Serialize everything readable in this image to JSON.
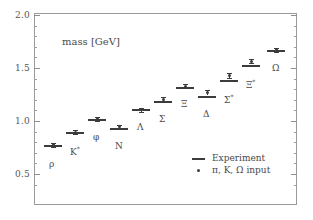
{
  "chart_data": {
    "type": "scatter",
    "title": "mass [GeV]",
    "xlabel": "",
    "ylabel": "mass [GeV]",
    "ylim": [
      0.35,
      2.0
    ],
    "yticks": [
      "2.0",
      "1.5",
      "1.0",
      "0.5"
    ],
    "ytick_values": [
      2.0,
      1.5,
      1.0,
      0.5
    ],
    "grid": false,
    "legend_position": "lower right",
    "categories": [
      "rho",
      "K*",
      "phi",
      "N",
      "Lambda",
      "Sigma",
      "Xi",
      "Delta",
      "Sigma*",
      "Xi*",
      "Omega"
    ],
    "series": [
      {
        "name": "Experiment",
        "marker": "bar",
        "values": [
          0.77,
          0.895,
          1.019,
          0.939,
          1.116,
          1.193,
          1.318,
          1.232,
          1.385,
          1.533,
          1.672
        ]
      },
      {
        "name": "pi, K, Omega input",
        "marker": "dot",
        "values": [
          0.775,
          0.893,
          1.02,
          0.945,
          1.104,
          1.205,
          1.33,
          1.267,
          1.43,
          1.565,
          1.672
        ],
        "errors": [
          0.022,
          0.012,
          0.008,
          0.02,
          0.018,
          0.016,
          0.012,
          0.026,
          0.022,
          0.016,
          0.006
        ]
      }
    ],
    "points": [
      {
        "label": "ρ",
        "label_html": "ρ",
        "x_px": 53,
        "exp": 0.77,
        "lat": 0.775,
        "err": 0.022,
        "label_dx": -4,
        "label_dy": 14
      },
      {
        "label": "K*",
        "label_html": "K<sup>*</sup>",
        "x_px": 75,
        "exp": 0.895,
        "lat": 0.893,
        "err": 0.012,
        "label_dx": -5,
        "label_dy": 13
      },
      {
        "label": "φ",
        "label_html": "φ",
        "x_px": 97,
        "exp": 1.019,
        "lat": 1.02,
        "err": 0.008,
        "label_dx": -4,
        "label_dy": 13
      },
      {
        "label": "N",
        "label_html": "N",
        "x_px": 119,
        "exp": 0.939,
        "lat": 0.945,
        "err": 0.02,
        "label_dx": -4,
        "label_dy": 14
      },
      {
        "label": "Λ",
        "label_html": "Λ",
        "x_px": 141,
        "exp": 1.116,
        "lat": 1.104,
        "err": 0.018,
        "label_dx": -4,
        "label_dy": 12
      },
      {
        "label": "Σ",
        "label_html": "Σ",
        "x_px": 163,
        "exp": 1.193,
        "lat": 1.205,
        "err": 0.016,
        "label_dx": -4,
        "label_dy": 13
      },
      {
        "label": "Ξ",
        "label_html": "Ξ",
        "x_px": 185,
        "exp": 1.318,
        "lat": 1.33,
        "err": 0.012,
        "label_dx": -4,
        "label_dy": 12
      },
      {
        "label": "Δ",
        "label_html": "Δ",
        "x_px": 207,
        "exp": 1.232,
        "lat": 1.267,
        "err": 0.026,
        "label_dx": -4,
        "label_dy": 13
      },
      {
        "label": "Σ*",
        "label_html": "Σ<sup>*</sup>",
        "x_px": 229,
        "exp": 1.385,
        "lat": 1.43,
        "err": 0.022,
        "label_dx": -5,
        "label_dy": 13
      },
      {
        "label": "Ξ*",
        "label_html": "Ξ<sup>*</sup>",
        "x_px": 251,
        "exp": 1.533,
        "lat": 1.565,
        "err": 0.016,
        "label_dx": -5,
        "label_dy": 13
      },
      {
        "label": "Ω",
        "label_html": "Ω",
        "x_px": 276,
        "exp": 1.672,
        "lat": 1.672,
        "err": 0.006,
        "label_dx": -4,
        "label_dy": 13
      }
    ],
    "legend_entries": [
      {
        "marker": "line",
        "text": "Experiment"
      },
      {
        "marker": "dot",
        "text": "π, K, Ω input"
      }
    ]
  },
  "axis": {
    "tick_2_0": "2.0",
    "tick_1_5": "1.5",
    "tick_1_0": "1.0",
    "tick_0_5": "0.5"
  },
  "annotations": {
    "axis_title": "mass [GeV]"
  }
}
